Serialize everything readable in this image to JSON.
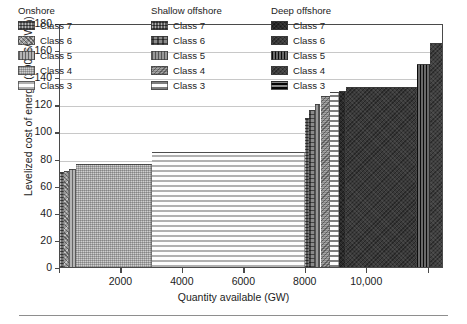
{
  "axes": {
    "y": {
      "label": "Levelized cost of energy (2006$/MWh)",
      "ticks": [
        0,
        20,
        40,
        60,
        80,
        100,
        120,
        140,
        160,
        180
      ],
      "min": 0,
      "max": 180
    },
    "x": {
      "label": "Quantity available (GW)",
      "ticks": [
        0,
        2000,
        4000,
        6000,
        8000,
        10000,
        12000
      ],
      "tick_labels": [
        "",
        "2000",
        "4000",
        "6000",
        "8000",
        "10,000",
        ""
      ],
      "min": 0,
      "max": 12500
    }
  },
  "legend": {
    "columns": [
      {
        "heading": "Onshore",
        "entries": [
          {
            "label": "Class 7",
            "pattern": "crosshatch-dense",
            "color": "#6e6e6e"
          },
          {
            "label": "Class 6",
            "pattern": "speckle-diag",
            "color": "#9a9a9a"
          },
          {
            "label": "Class 5",
            "pattern": "vertical-lines",
            "color": "#b4b4b4"
          },
          {
            "label": "Class 4",
            "pattern": "fine-stipple",
            "color": "#cfcfcf"
          },
          {
            "label": "Class 3",
            "pattern": "horizontal-lines",
            "color": "#b0b0b0"
          }
        ]
      },
      {
        "heading": "Shallow offshore",
        "entries": [
          {
            "label": "Class 7",
            "pattern": "crosshatch-dense",
            "color": "#5a5a5a"
          },
          {
            "label": "Class 6",
            "pattern": "grid-blocks",
            "color": "#8a8a8a"
          },
          {
            "label": "Class 5",
            "pattern": "vertical-lines",
            "color": "#989898"
          },
          {
            "label": "Class 4",
            "pattern": "diag-stipple",
            "color": "#a6a6a6"
          },
          {
            "label": "Class 3",
            "pattern": "horizontal-lines",
            "color": "#7e7e7e"
          }
        ]
      },
      {
        "heading": "Deep offshore",
        "entries": [
          {
            "label": "Class 7",
            "pattern": "solid-dark",
            "color": "#2a2a2a"
          },
          {
            "label": "Class 6",
            "pattern": "solid-dark",
            "color": "#3a3a3a"
          },
          {
            "label": "Class 5",
            "pattern": "vertical-lines-dark",
            "color": "#484848"
          },
          {
            "label": "Class 4",
            "pattern": "solid-dark",
            "color": "#404040"
          },
          {
            "label": "Class 3",
            "pattern": "horizontal-lines-dark",
            "color": "#4e4e4e"
          }
        ]
      }
    ]
  },
  "chart_data": {
    "type": "bar",
    "title": "",
    "xlabel": "Quantity available (GW)",
    "ylabel": "Levelized cost of energy (2006$/MWh)",
    "xlim": [
      0,
      12500
    ],
    "ylim": [
      0,
      180
    ],
    "grid": "horizontal",
    "legend_position": "inside-top-left",
    "steps": [
      {
        "series": "Onshore Class 7",
        "x_start": 0,
        "x_end": 120,
        "cost": 70
      },
      {
        "series": "Onshore Class 6",
        "x_start": 120,
        "x_end": 300,
        "cost": 71
      },
      {
        "series": "Onshore Class 5",
        "x_start": 300,
        "x_end": 520,
        "cost": 72
      },
      {
        "series": "Onshore Class 4",
        "x_start": 520,
        "x_end": 2980,
        "cost": 76
      },
      {
        "series": "Onshore Class 3",
        "x_start": 2980,
        "x_end": 7980,
        "cost": 85
      },
      {
        "series": "Shallow offshore Class 7",
        "x_start": 7980,
        "x_end": 8120,
        "cost": 110
      },
      {
        "series": "Shallow offshore Class 6",
        "x_start": 8120,
        "x_end": 8300,
        "cost": 116
      },
      {
        "series": "Shallow offshore Class 5",
        "x_start": 8300,
        "x_end": 8480,
        "cost": 120
      },
      {
        "series": "Shallow offshore Class 4",
        "x_start": 8480,
        "x_end": 8780,
        "cost": 126
      },
      {
        "series": "Shallow offshore Class 3",
        "x_start": 8780,
        "x_end": 9080,
        "cost": 129
      },
      {
        "series": "Deep offshore Class 7",
        "x_start": 9080,
        "x_end": 9320,
        "cost": 130
      },
      {
        "series": "Deep offshore Class 6",
        "x_start": 9320,
        "x_end": 11620,
        "cost": 133
      },
      {
        "series": "Deep offshore Class 5",
        "x_start": 11620,
        "x_end": 12060,
        "cost": 150
      },
      {
        "series": "Deep offshore Class 4",
        "x_start": 12060,
        "x_end": 12500,
        "cost": 165
      }
    ]
  }
}
